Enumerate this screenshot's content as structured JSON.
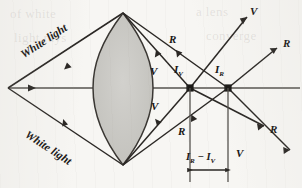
{
  "figure": {
    "background_color": "#f7f6f3",
    "ink_color": "#2a2724",
    "lens_fill_color": "#c9c8c4",
    "axis_color": "#55524e"
  },
  "labels": {
    "white_light_top": "White light",
    "white_light_bottom": "White light",
    "ray_r_upper_inner": "R",
    "ray_v_upper_inner": "V",
    "ray_v_lower_inner": "V",
    "ray_r_lower_inner": "R",
    "ray_v_upper_right": "V",
    "ray_r_upper_right": "R",
    "ray_r_lower_right": "R",
    "ray_v_lower_right": "V",
    "image_violet": "I",
    "image_violet_sub": "V",
    "image_red": "I",
    "image_red_sub": "R",
    "dimension_lead": "I",
    "dimension_lead_sub": "R",
    "dimension_minus": " − ",
    "dimension_tail": "I",
    "dimension_tail_sub": "V"
  },
  "geometry": {
    "source_vertex": [
      8,
      88
    ],
    "lens_center": [
      123,
      88
    ],
    "lens_top_apex": [
      123,
      13
    ],
    "lens_bottom_apex": [
      123,
      165
    ],
    "focus_violet": [
      190,
      88
    ],
    "focus_red": [
      228,
      88
    ],
    "axis_y": 88,
    "axis_x_start": 8,
    "axis_x_end": 300,
    "dimension_y": 170,
    "dimension_x_start": 190,
    "dimension_x_end": 228
  },
  "ghost_text": {
    "line1": "of white",
    "line2": "a lens",
    "line3": "light rays",
    "line4": "converge"
  }
}
